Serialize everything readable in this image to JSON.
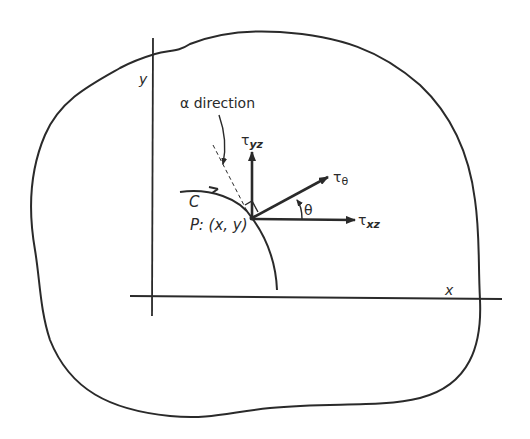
{
  "diagram": {
    "type": "cross-section shear stress diagram",
    "labels": {
      "y_axis": "y",
      "x_axis": "x",
      "alpha_direction": "α direction",
      "tau_yz_main": "τ",
      "tau_yz_sub": "yz",
      "tau_theta_main": "τ",
      "tau_theta_sub": "θ",
      "tau_xz_main": "τ",
      "tau_xz_sub": "xz",
      "theta": "θ",
      "curve_c": "C",
      "point_p": "P: (x, y)"
    },
    "colors": {
      "stroke": "#2a2a2a",
      "background": "#ffffff"
    }
  }
}
